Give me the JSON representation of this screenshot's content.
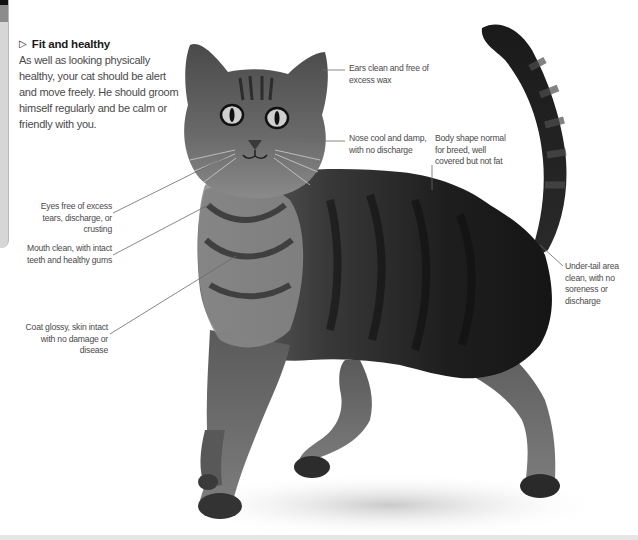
{
  "intro": {
    "heading_icon": "triangle-right-outline",
    "heading": "Fit and healthy",
    "body": "As well as looking physically healthy, your cat should be alert and move freely. He should groom himself regularly and be calm or friendly with you."
  },
  "annotations": {
    "ears": "Ears clean and free of excess wax",
    "nose": "Nose cool and damp, with no discharge",
    "body_shape": "Body shape normal for breed, well covered but not fat",
    "eyes": "Eyes free of excess tears, discharge, or crusting",
    "mouth": "Mouth clean, with intact teeth and healthy gums",
    "coat": "Coat glossy, skin intact with no damage or disease",
    "under_tail": "Under-tail area clean, with no soreness or discharge"
  },
  "image": {
    "subject": "tabby cat standing, tail raised",
    "palette": [
      "#111111",
      "#3c3c3c",
      "#7a7a7a",
      "#bdbdbd"
    ]
  }
}
